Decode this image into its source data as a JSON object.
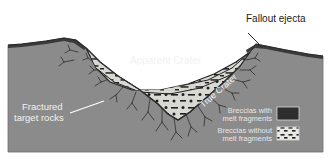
{
  "figure": {
    "kind": "impact-crater-cross-section",
    "background_color": "#ffffff",
    "ground_color": "#8b8b8b",
    "ground_shadow_color": "#7c7c7c",
    "ejecta_color": "#3a3a3a",
    "breccia_fill_color": "#d9d9d4",
    "outline_color": "#2b2b2b",
    "label_light_color": "#f2f2f2",
    "label_dark_color": "#1a1a1a"
  },
  "labels": {
    "fallout_ejecta": "Fallout ejecta",
    "apparent_crater": "Apparent Crater",
    "true_crater": "True Crater",
    "fractured_target_rocks_line1": "Fractured",
    "fractured_target_rocks_line2": "target rocks"
  },
  "legend": {
    "items": [
      {
        "line1": "Breccias with",
        "line2": "melt fragments",
        "swatch": "solid-dark",
        "swatch_color": "#2e2e2e"
      },
      {
        "line1": "Breccias without",
        "line2": "melt fragments",
        "swatch": "light-with-dashes",
        "swatch_color": "#e8e8e4",
        "swatch_mark_color": "#1f1f1f"
      }
    ]
  }
}
